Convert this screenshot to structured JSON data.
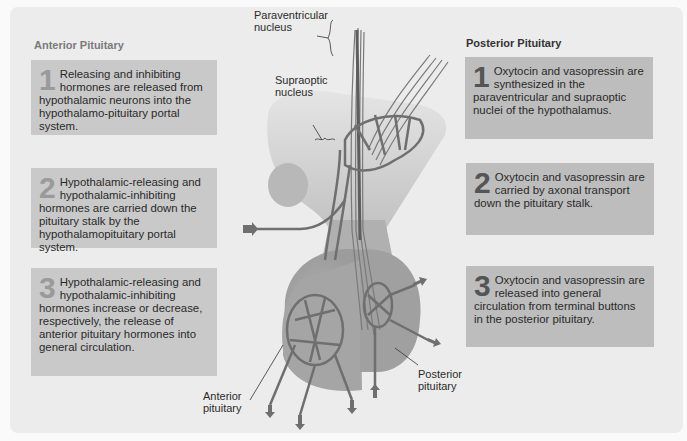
{
  "figure": {
    "anterior": {
      "title": "Anterior Pituitary",
      "steps": [
        {
          "num": "1",
          "text": "Releasing and inhibiting hormones are released from hypothalamic neurons into the hypothalamo-pituitary portal system."
        },
        {
          "num": "2",
          "text": "Hypothalamic-releasing and hypothalamic-inhibiting hormones are carried down the pituitary stalk by the hypothalamopituitary portal system."
        },
        {
          "num": "3",
          "text": "Hypothalamic-releasing and hypothalamic-inhibiting hormones increase or decrease, respectively, the release of anterior pituitary hormones into general circulation."
        }
      ]
    },
    "posterior": {
      "title": "Posterior Pituitary",
      "steps": [
        {
          "num": "1",
          "text": "Oxytocin and vasopressin are synthesized in the paraventricular and supraoptic nuclei of the hypothalamus."
        },
        {
          "num": "2",
          "text": "Oxytocin and vasopressin are carried by axonal transport down the pituitary stalk."
        },
        {
          "num": "3",
          "text": "Oxytocin and vasopressin are released into general circulation from terminal buttons in the posterior pituitary."
        }
      ]
    },
    "labels": {
      "paraventricular_1": "Paraventricular",
      "paraventricular_2": "nucleus",
      "supraoptic_1": "Supraoptic",
      "supraoptic_2": "nucleus",
      "anterior_1": "Anterior",
      "anterior_2": "pituitary",
      "posterior_1": "Posterior",
      "posterior_2": "pituitary"
    },
    "colors": {
      "panel": "#ececec",
      "box_left": "#c9c9c9",
      "box_right": "#bdbdbd",
      "vessel": "#6f6f6f",
      "gland": "#a8a8a8"
    }
  }
}
